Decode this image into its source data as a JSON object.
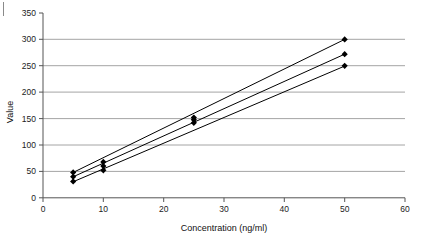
{
  "chart_data": {
    "type": "scatter",
    "title": "",
    "xlabel": "Concentration (ng/ml)",
    "ylabel": "Value",
    "xlim": [
      0,
      60
    ],
    "ylim": [
      0,
      350
    ],
    "xticks": [
      0,
      10,
      20,
      30,
      40,
      50,
      60
    ],
    "yticks": [
      0,
      50,
      100,
      150,
      200,
      250,
      300,
      350
    ],
    "grid": "horizontal",
    "legend": "none",
    "x": [
      5,
      10,
      25,
      50
    ],
    "series": [
      {
        "name": "Upper",
        "type": "line+markers",
        "values": [
          48,
          68,
          152,
          300
        ],
        "slope": 5.6,
        "intercept": 20
      },
      {
        "name": "Middle",
        "type": "line+markers",
        "values": [
          40,
          60,
          148,
          272
        ],
        "slope": 5.16,
        "intercept": 14
      },
      {
        "name": "Lower",
        "type": "line+markers",
        "values": [
          31,
          52,
          142,
          250
        ],
        "slope": 4.87,
        "intercept": 6
      }
    ],
    "marker": "filled-diamond",
    "marker_color": "#000000",
    "line_color": "#000000",
    "gridline_color": "#9a9a9a",
    "axis_color": "#555555"
  },
  "axes": {
    "y_title": "Value",
    "x_title": "Concentration (ng/ml)",
    "y_tick_labels": [
      "0",
      "50",
      "100",
      "150",
      "200",
      "250",
      "300",
      "350"
    ],
    "x_tick_labels": [
      "0",
      "10",
      "20",
      "30",
      "40",
      "50",
      "60"
    ]
  }
}
